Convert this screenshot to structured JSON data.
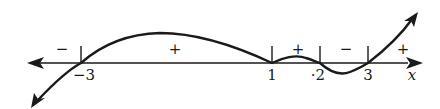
{
  "diagram": {
    "type": "sign-chart",
    "axis": {
      "variable": "x",
      "arrows": "both"
    },
    "critical_points": [
      {
        "value": -3,
        "label": "−3",
        "x": 81
      },
      {
        "value": 1,
        "label": "1",
        "x": 272
      },
      {
        "value": 2,
        "label": "·2",
        "x": 320
      },
      {
        "value": 3,
        "label": "3",
        "x": 368
      }
    ],
    "signs": [
      {
        "interval": "(-∞, -3)",
        "sign": "−",
        "x": 62
      },
      {
        "interval": "(-3, 1)",
        "sign": "+",
        "x": 175
      },
      {
        "interval": "(1, 2)",
        "sign": "+",
        "x": 298
      },
      {
        "interval": "(2, 3)",
        "sign": "−",
        "x": 346
      },
      {
        "interval": "(3, ∞)",
        "sign": "+",
        "x": 403
      }
    ],
    "colors": {
      "stroke": "#1a1a1a",
      "background": "#ffffff"
    }
  }
}
